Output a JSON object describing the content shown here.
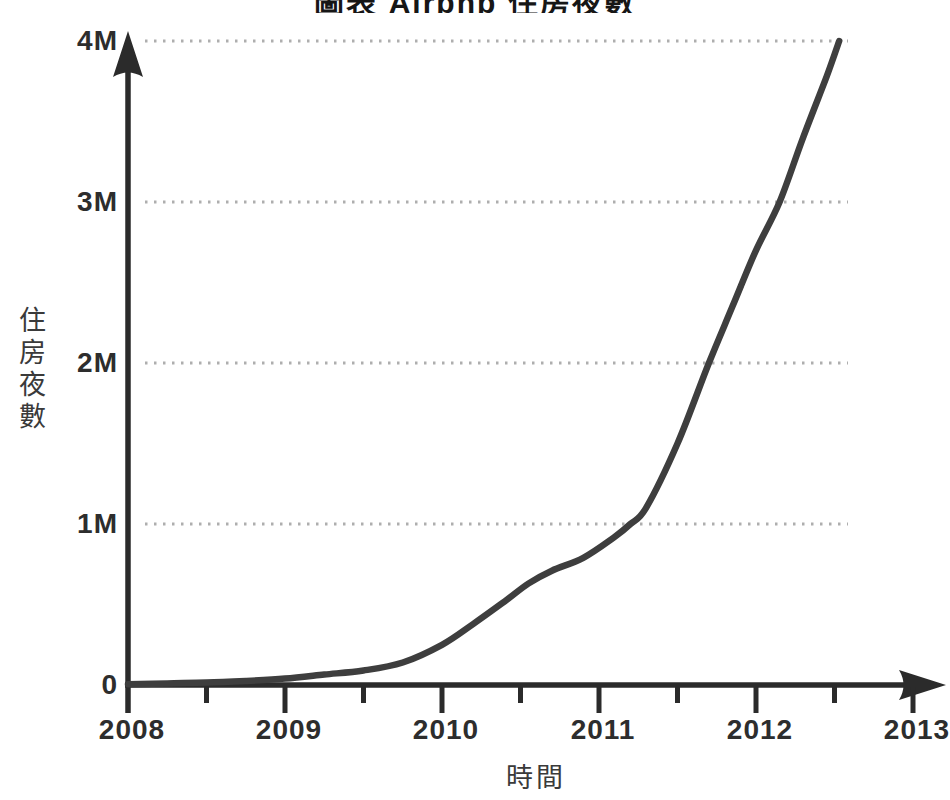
{
  "title": {
    "cropped_text": "圖表 Airbnb 住房夜數",
    "note_visible_state": "title is cut off at top edge; only bottom sliver of glyphs visible"
  },
  "chart_data": {
    "type": "line",
    "xlabel": "時間",
    "ylabel": "住房夜數",
    "x_axis": {
      "min": 2008,
      "max": 2013,
      "major_tick_labels": [
        "2008",
        "2009",
        "2010",
        "2011",
        "2012",
        "2013"
      ],
      "major_tick_years": [
        2008,
        2009,
        2010,
        2011,
        2012,
        2013
      ],
      "minor_tick_years": [
        2008.5,
        2009.5,
        2010.5,
        2011.5,
        2012.5
      ],
      "arrow": "right"
    },
    "y_axis": {
      "min": 0,
      "max": 4000000,
      "tick_labels": [
        {
          "value": 0,
          "label": "0"
        },
        {
          "value": 1,
          "label": "1M"
        },
        {
          "value": 2,
          "label": "2M"
        },
        {
          "value": 3,
          "label": "3M"
        },
        {
          "value": 4,
          "label": "4M"
        }
      ],
      "unit": "millions of room nights",
      "arrow": "up"
    },
    "grid": {
      "horizontal_dotted_at_millions": [
        1,
        2,
        3,
        4
      ],
      "style": "dotted",
      "on": true
    },
    "legend": "none",
    "series": [
      {
        "name": "住房夜數",
        "unit_y": "millions",
        "unit_x": "year",
        "points": [
          [
            2008.0,
            0.005
          ],
          [
            2008.25,
            0.01
          ],
          [
            2008.5,
            0.015
          ],
          [
            2008.75,
            0.025
          ],
          [
            2009.0,
            0.04
          ],
          [
            2009.25,
            0.065
          ],
          [
            2009.5,
            0.09
          ],
          [
            2009.75,
            0.14
          ],
          [
            2010.0,
            0.25
          ],
          [
            2010.2,
            0.38
          ],
          [
            2010.4,
            0.52
          ],
          [
            2010.55,
            0.63
          ],
          [
            2010.7,
            0.71
          ],
          [
            2010.9,
            0.79
          ],
          [
            2011.1,
            0.92
          ],
          [
            2011.2,
            1.0
          ],
          [
            2011.3,
            1.1
          ],
          [
            2011.5,
            1.5
          ],
          [
            2011.7,
            2.0
          ],
          [
            2011.85,
            2.35
          ],
          [
            2012.0,
            2.7
          ],
          [
            2012.15,
            3.0
          ],
          [
            2012.3,
            3.4
          ],
          [
            2012.45,
            3.78
          ],
          [
            2012.53,
            4.0
          ]
        ]
      }
    ],
    "colors": {
      "line": "#3e3e3e",
      "axis": "#2b2b2b",
      "grid_dots": "#aeaeae",
      "tick_text": "#2d2d2d",
      "cjk_text": "#3a3a3a",
      "background": "#ffffff"
    }
  }
}
